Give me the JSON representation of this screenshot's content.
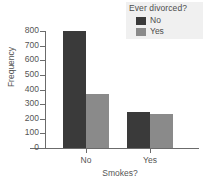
{
  "chart_data": {
    "type": "bar",
    "title": "",
    "xlabel": "Smokes?",
    "ylabel": "Frequency",
    "categories": [
      "No",
      "Yes"
    ],
    "series": [
      {
        "name": "No",
        "values": [
          800,
          243
        ],
        "color": "#3a3a3a"
      },
      {
        "name": "Yes",
        "values": [
          370,
          236
        ],
        "color": "#8a8a8a"
      }
    ],
    "legend_title": "Ever divorced?",
    "legend_position": "top-right",
    "grid": false,
    "ylim": [
      0,
      800
    ],
    "yticks": [
      800,
      700,
      600,
      500,
      400,
      300,
      200,
      100,
      0
    ],
    "ytick_labels": [
      "800",
      "700",
      "600",
      "500",
      "400",
      "300",
      "200",
      "100",
      "0"
    ]
  },
  "axes": {
    "y_title": "Frequency",
    "x_title": "Smokes?",
    "y_ticks": [
      {
        "label": "800",
        "value": 800
      },
      {
        "label": "700",
        "value": 700
      },
      {
        "label": "600",
        "value": 600
      },
      {
        "label": "500",
        "value": 500
      },
      {
        "label": "400",
        "value": 400
      },
      {
        "label": "300",
        "value": 300
      },
      {
        "label": "200",
        "value": 200
      },
      {
        "label": "100",
        "value": 100
      },
      {
        "label": "0",
        "value": 0
      }
    ],
    "x_categories": [
      {
        "label": "No"
      },
      {
        "label": "Yes"
      }
    ]
  },
  "legend": {
    "title": "Ever divorced?",
    "entries": [
      {
        "label": "No",
        "color": "#3a3a3a"
      },
      {
        "label": "Yes",
        "color": "#8a8a8a"
      }
    ]
  },
  "colors": {
    "series_no": "#3a3a3a",
    "series_yes": "#8a8a8a",
    "axis": "#6b6b6b",
    "text": "#555555",
    "legend_background": "#f0f0f0",
    "background": "#ffffff"
  }
}
